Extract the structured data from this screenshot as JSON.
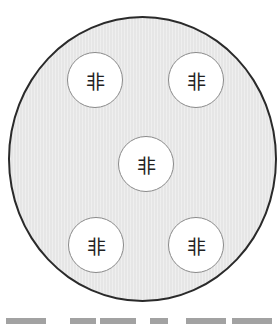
{
  "diagram": {
    "container": {
      "shape": "circle",
      "fill": "#e6e6e6",
      "stroke": "#2a2a2a"
    },
    "nodes": [
      {
        "id": "top-left",
        "label": "非",
        "x": 95,
        "y": 80
      },
      {
        "id": "top-right",
        "label": "非",
        "x": 196,
        "y": 80
      },
      {
        "id": "center",
        "label": "非",
        "x": 146,
        "y": 164
      },
      {
        "id": "bottom-left",
        "label": "非",
        "x": 96,
        "y": 245
      },
      {
        "id": "bottom-right",
        "label": "非",
        "x": 196,
        "y": 245
      }
    ],
    "node_style": {
      "fill": "#ffffff",
      "stroke": "#8a8a8a",
      "text_color": "#222222"
    }
  }
}
